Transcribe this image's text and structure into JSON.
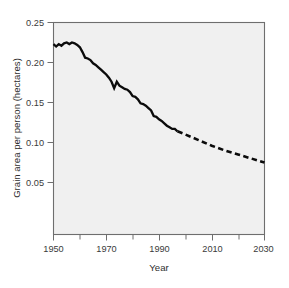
{
  "chart_data": {
    "type": "line",
    "title": "",
    "subtitle": "",
    "xlabel": "Year",
    "ylabel": "Grain area per person (hectares)",
    "xlim": [
      1950,
      2030
    ],
    "ylim": [
      0.0,
      0.25
    ],
    "grid": false,
    "legend": "none",
    "plot_background": "#f0f0f0",
    "line_color": "#0b0b0b",
    "x_ticks_major": [
      1950,
      1970,
      1990,
      2010,
      2030
    ],
    "x_tick_labels": [
      "1950",
      "1970",
      "1990",
      "2010",
      "2030"
    ],
    "x_ticks_minor": [
      1960,
      1980,
      2000,
      2020
    ],
    "y_ticks_major": [
      0.05,
      0.1,
      0.15,
      0.2,
      0.25
    ],
    "y_tick_labels": [
      "0.05",
      "0.10",
      "0.15",
      "0.20",
      "0.25"
    ],
    "annotations": [
      "Solid line: historical data 1950-1997",
      "Dashed line: projection 1997-2030"
    ],
    "series": [
      {
        "name": "Grain area per person (historical)",
        "style": "solid",
        "x": [
          1950,
          1951,
          1952,
          1953,
          1954,
          1955,
          1956,
          1957,
          1958,
          1959,
          1960,
          1961,
          1962,
          1963,
          1964,
          1965,
          1966,
          1967,
          1968,
          1969,
          1970,
          1971,
          1972,
          1973,
          1974,
          1975,
          1976,
          1977,
          1978,
          1979,
          1980,
          1981,
          1982,
          1983,
          1984,
          1985,
          1986,
          1987,
          1988,
          1989,
          1990,
          1991,
          1992,
          1993,
          1994,
          1995,
          1996,
          1997
        ],
        "values": [
          0.223,
          0.22,
          0.223,
          0.221,
          0.224,
          0.225,
          0.223,
          0.225,
          0.224,
          0.222,
          0.219,
          0.213,
          0.206,
          0.205,
          0.203,
          0.199,
          0.197,
          0.194,
          0.191,
          0.188,
          0.185,
          0.181,
          0.176,
          0.168,
          0.176,
          0.171,
          0.169,
          0.167,
          0.166,
          0.163,
          0.158,
          0.157,
          0.154,
          0.149,
          0.148,
          0.146,
          0.143,
          0.14,
          0.133,
          0.132,
          0.129,
          0.127,
          0.124,
          0.121,
          0.119,
          0.117,
          0.117,
          0.114
        ]
      },
      {
        "name": "Grain area per person (projected)",
        "style": "dashed",
        "x": [
          1997,
          2000,
          2005,
          2010,
          2015,
          2020,
          2025,
          2030
        ],
        "values": [
          0.114,
          0.11,
          0.103,
          0.096,
          0.09,
          0.085,
          0.08,
          0.075
        ]
      }
    ]
  },
  "axes": {
    "y_label": "Grain area per person (hectares)",
    "x_label": "Year"
  },
  "y_tick_labels": {
    "t0": "0.05",
    "t1": "0.10",
    "t2": "0.15",
    "t3": "0.20",
    "t4": "0.25"
  },
  "x_tick_labels": {
    "t0": "1950",
    "t1": "1970",
    "t2": "1990",
    "t3": "2010",
    "t4": "2030"
  }
}
